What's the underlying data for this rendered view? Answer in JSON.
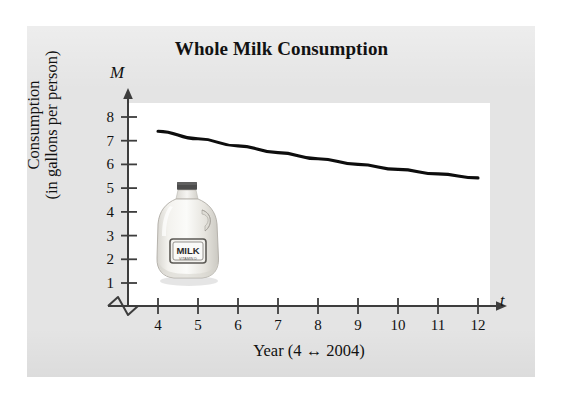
{
  "figure": {
    "title": "Whole Milk Consumption",
    "background_color": "#e4e4e4",
    "plot_background_color": "#ffffff",
    "line_color": "#0d0d0d"
  },
  "axes": {
    "y_symbol": "M",
    "x_symbol": "t",
    "y_caption_line1": "Consumption",
    "y_caption_line2": "(in gallons per person)",
    "x_caption": "Year (4 ↔ 2004)",
    "y_ticks": [
      "1",
      "2",
      "3",
      "4",
      "5",
      "6",
      "7",
      "8"
    ],
    "x_ticks": [
      "4",
      "5",
      "6",
      "7",
      "8",
      "9",
      "10",
      "11",
      "12"
    ],
    "axis_break_symbol": "zigzag-break"
  },
  "artwork": {
    "jug_label_text": "MILK",
    "jug_sublabel_text": "VITAMIN D",
    "cap_color": "#4c4c4c",
    "body_color": "#eceae5"
  },
  "chart_data": {
    "type": "line",
    "title": "Whole Milk Consumption",
    "xlabel": "Year (4 ↔ 2004)",
    "ylabel": "Consumption (in gallons per person)",
    "x_symbol": "t",
    "y_symbol": "M",
    "xlim": [
      4,
      12
    ],
    "ylim": [
      0,
      8.6
    ],
    "grid": false,
    "legend": null,
    "x": [
      4,
      5,
      6,
      7,
      8,
      9,
      10,
      11,
      12
    ],
    "series": [
      {
        "name": "Whole milk consumption",
        "values": [
          7.4,
          7.08,
          6.78,
          6.5,
          6.24,
          6.0,
          5.79,
          5.6,
          5.43
        ]
      }
    ]
  }
}
